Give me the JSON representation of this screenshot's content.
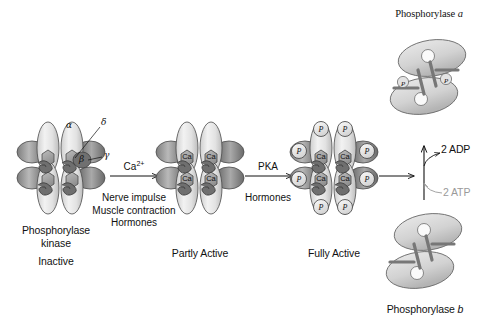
{
  "figure": {
    "title_phosphorylase_a": "Phosphorylase a",
    "title_phosphorylase_b": "Phosphorylase b"
  },
  "complexes": [
    {
      "id": "phosphorylase-kinase-inactive",
      "name_line1": "Phosphorylase",
      "name_line2": "kinase",
      "state": "Inactive",
      "subunit_labels": [
        "α",
        "δ",
        "β",
        "γ"
      ],
      "ca_count": 0,
      "p_count": 0
    },
    {
      "id": "phosphorylase-kinase-partly-active",
      "name_line1": "",
      "name_line2": "",
      "state": "Partly Active",
      "subunit_labels": [],
      "ca_label": "Ca",
      "ca_count": 4,
      "p_count": 0
    },
    {
      "id": "phosphorylase-kinase-fully-active",
      "name_line1": "",
      "name_line2": "",
      "state": "Fully Active",
      "subunit_labels": [],
      "ca_label": "Ca",
      "p_label": "P",
      "ca_count": 4,
      "p_count": 8
    }
  ],
  "arrows": [
    {
      "id": "arrow-1",
      "above": "Ca",
      "above_sup": "2+",
      "below_lines": [
        "Nerve impulse",
        "Muscle contraction",
        "Hormones"
      ]
    },
    {
      "id": "arrow-2",
      "above": "PKA",
      "above_sup": "",
      "below_lines": [
        "Hormones"
      ]
    },
    {
      "id": "arrow-3",
      "above": "",
      "above_sup": "",
      "below_lines": []
    }
  ],
  "conversion": {
    "product_label": "2 ADP",
    "substrate_label": "2 ATP"
  },
  "phosphate_tag": "P",
  "colors": {
    "ink": "#111111",
    "faint_ink": "#9a9a9a",
    "light_subunit": "#e6e6e6",
    "mid_subunit": "#b3b3b3",
    "dark_subunit": "#6e6e6e",
    "hexagon": "#9c9c9c",
    "outline": "#4a4a4a"
  }
}
